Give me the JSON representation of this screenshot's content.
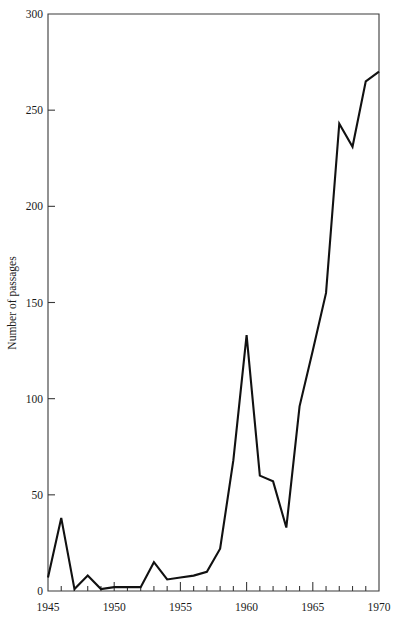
{
  "chart_data": {
    "type": "line",
    "title": "",
    "xlabel": "",
    "ylabel": "Number of passages",
    "xlim": [
      1945,
      1970
    ],
    "ylim": [
      0,
      300
    ],
    "grid": false,
    "legend": "none",
    "x_major_ticks": [
      1945,
      1950,
      1955,
      1960,
      1965,
      1970
    ],
    "x_major_tick_labels": [
      "1945",
      "1950",
      "1955",
      "1960",
      "1965",
      "1970"
    ],
    "x_minor_tick_step": 1,
    "y_major_ticks": [
      0,
      50,
      100,
      150,
      200,
      250,
      300
    ],
    "y_major_tick_labels": [
      "0",
      "50",
      "100",
      "150",
      "200",
      "250",
      "300"
    ],
    "x": [
      1945,
      1946,
      1947,
      1948,
      1949,
      1950,
      1951,
      1952,
      1953,
      1954,
      1955,
      1956,
      1957,
      1958,
      1959,
      1960,
      1961,
      1962,
      1963,
      1964,
      1965,
      1966,
      1967,
      1968,
      1969,
      1970
    ],
    "values": [
      7,
      38,
      1,
      8,
      1,
      2,
      2,
      2,
      15,
      6,
      7,
      8,
      10,
      22,
      68,
      133,
      60,
      57,
      33,
      96,
      125,
      155,
      243,
      231,
      265,
      270
    ],
    "series": [
      {
        "name": "Number of passages",
        "color": "#111111",
        "values": [
          7,
          38,
          1,
          8,
          1,
          2,
          2,
          2,
          15,
          6,
          7,
          8,
          10,
          22,
          68,
          133,
          60,
          57,
          33,
          96,
          125,
          155,
          243,
          231,
          265,
          270
        ]
      }
    ]
  },
  "axes": {
    "y_axis_title": "Number of passages",
    "frame_color": "#3a3a3a",
    "line_color": "#111111"
  }
}
